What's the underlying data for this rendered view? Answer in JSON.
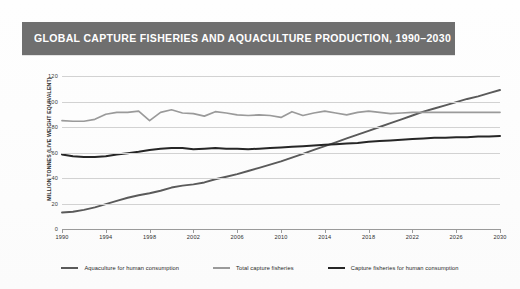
{
  "banner": {
    "title": "GLOBAL CAPTURE FISHERIES AND AQUACULTURE PRODUCTION, 1990–2030",
    "background_color": "#6f6f6f",
    "text_color": "#ffffff"
  },
  "chart_data": {
    "type": "line",
    "title": "GLOBAL CAPTURE FISHERIES AND AQUACULTURE PRODUCTION, 1990–2030",
    "xlabel": "",
    "ylabel": "MILLION TONNES (LIVE WEIGHT EQUIVALENT)",
    "xlim": [
      1990,
      2030
    ],
    "ylim": [
      0,
      120
    ],
    "yticks": [
      0,
      20,
      40,
      60,
      80,
      100,
      120
    ],
    "xticks": [
      1990,
      1994,
      1998,
      2002,
      2006,
      2010,
      2014,
      2018,
      2022,
      2026,
      2030
    ],
    "grid": true,
    "legend_position": "bottom",
    "x": [
      1990,
      1991,
      1992,
      1993,
      1994,
      1995,
      1996,
      1997,
      1998,
      1999,
      2000,
      2001,
      2002,
      2003,
      2004,
      2005,
      2006,
      2007,
      2008,
      2009,
      2010,
      2011,
      2012,
      2013,
      2014,
      2015,
      2016,
      2017,
      2018,
      2019,
      2020,
      2021,
      2022,
      2023,
      2024,
      2025,
      2026,
      2027,
      2028,
      2029,
      2030
    ],
    "series": [
      {
        "name": "Aquaculture for human consumption",
        "color": "#5a5a5a",
        "values": [
          13,
          13.5,
          15,
          17,
          19.5,
          22,
          24.5,
          26.5,
          28,
          30,
          32.5,
          34,
          35,
          36.5,
          39,
          41,
          43,
          45.5,
          48,
          50.5,
          53,
          56,
          59,
          62,
          65,
          68,
          71,
          74,
          77,
          80,
          83,
          86,
          89,
          92,
          94.5,
          97,
          99.5,
          102,
          104,
          106.5,
          109
        ]
      },
      {
        "name": "Total capture fisheries",
        "color": "#9a9a9a",
        "values": [
          85,
          84.5,
          84.5,
          86,
          90,
          91.5,
          91.5,
          92.5,
          85,
          91.5,
          93.5,
          91,
          90.5,
          88.5,
          92,
          91,
          89.5,
          89,
          89.5,
          89,
          87.5,
          92,
          89,
          91,
          92.5,
          91,
          89.5,
          91.5,
          92.5,
          91.5,
          90.5,
          91,
          91.5,
          91.5,
          91.5,
          91.5,
          91.5,
          91.5,
          91.5,
          91.5,
          91.5
        ]
      },
      {
        "name": "Capture fisheries for human consumption",
        "color": "#262626",
        "values": [
          58.5,
          57,
          56.5,
          56.5,
          57,
          58.5,
          59.5,
          60.5,
          62,
          63,
          63.5,
          63.5,
          62.5,
          63,
          63.5,
          63,
          63,
          62.5,
          63,
          63.5,
          64,
          64.5,
          65,
          65.5,
          66,
          66.5,
          67,
          67.5,
          68.5,
          69,
          69.5,
          70,
          70.5,
          71,
          71.5,
          71.5,
          72,
          72,
          72.5,
          72.5,
          73
        ]
      }
    ]
  },
  "axes": {
    "y_title": "MILLION TONNES (LIVE WEIGHT EQUIVALENT)",
    "y_tick_labels": [
      "120",
      "100",
      "80",
      "60",
      "40",
      "20",
      "0"
    ],
    "x_tick_labels": [
      "1990",
      "1994",
      "1998",
      "2002",
      "2006",
      "2010",
      "2014",
      "2018",
      "2022",
      "2026",
      "2030"
    ],
    "gridline_color": "#d2d2d2",
    "axis_color": "#9a9a9a"
  },
  "legend": {
    "items": [
      {
        "label": "Aquaculture for human consumption",
        "color": "#5a5a5a"
      },
      {
        "label": "Total capture fisheries",
        "color": "#9a9a9a"
      },
      {
        "label": "Capture fisheries for human consumption",
        "color": "#262626"
      }
    ]
  }
}
